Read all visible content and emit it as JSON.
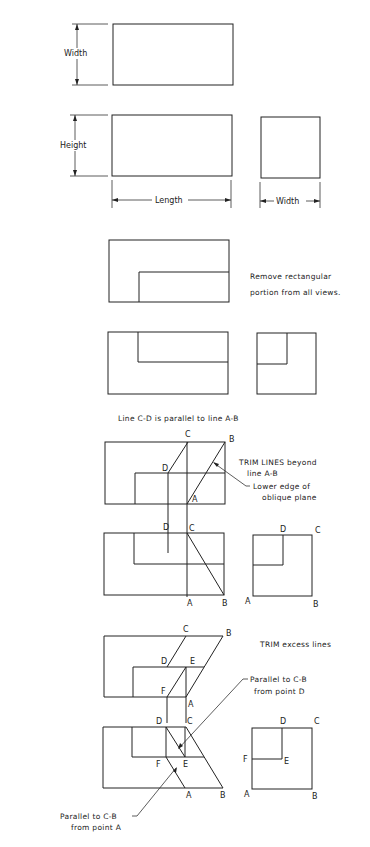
{
  "step1": {
    "dimensions": {
      "width_top": "Width",
      "height": "Height",
      "length": "Length",
      "width_side": "Width"
    }
  },
  "step2": {
    "note_line1": "Remove rectangular",
    "note_line2": "portion from all views."
  },
  "step3": {
    "title": "Line C-D is parallel to line A-B",
    "note_trim_line1": "TRIM LINES beyond",
    "note_trim_line2": "line A-B",
    "note_edge_line1": "Lower edge of",
    "note_edge_line2": "oblique plane",
    "points": {
      "A": "A",
      "B": "B",
      "C": "C",
      "D": "D"
    }
  },
  "step4": {
    "note_trim": "TRIM excess lines",
    "note_parallel_d_line1": "Parallel to C-B",
    "note_parallel_d_line2": "from point D",
    "note_parallel_a_line1": "Parallel to C-B",
    "note_parallel_a_line2": "from point A",
    "points": {
      "A": "A",
      "B": "B",
      "C": "C",
      "D": "D",
      "E": "E",
      "F": "F"
    }
  }
}
